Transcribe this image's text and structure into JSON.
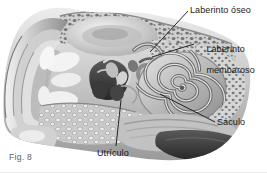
{
  "figure": {
    "caption": "Fig. 8",
    "background_color": "#ffffff",
    "label_color": "#1a1a1a",
    "caption_color": "#5d5d5d",
    "leader_line_color": "#111111"
  },
  "labels": {
    "bony_labyrinth": "Laberinto óseo",
    "membranous_labyrinth_line1": "Laberinto",
    "membranous_labyrinth_line2": "membaroso",
    "saccule": "Sáculo",
    "utricle": "Utrículo"
  },
  "palette": {
    "bone_light": "#d9d9d9",
    "bone_mid": "#b4b4b4",
    "bone_dark": "#8c8c8c",
    "cavity_dark": "#4a4a4a",
    "cavity_darkest": "#2e2e2e",
    "highlight": "#f0f0f0",
    "shadow": "#6e6e6e"
  }
}
